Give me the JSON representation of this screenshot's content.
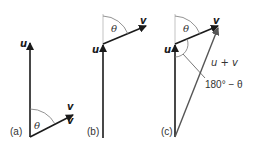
{
  "colors": {
    "vector": "#1a1a1a",
    "resultant": "#555555",
    "guide": "#aaaaaa",
    "arc": "#777777"
  },
  "panels": [
    {
      "id": "a",
      "label": "(a)",
      "vectors": {
        "u": "u",
        "v_top": "v",
        "v_bottom": "v"
      },
      "angle": "θ"
    },
    {
      "id": "b",
      "label": "(b)",
      "vectors": {
        "u": "u",
        "v": "v"
      },
      "angle": "θ"
    },
    {
      "id": "c",
      "label": "(c)",
      "vectors": {
        "u": "u",
        "v": "v",
        "sum": "u + v"
      },
      "angle": "θ",
      "supplementary_angle": "180° − θ"
    }
  ]
}
